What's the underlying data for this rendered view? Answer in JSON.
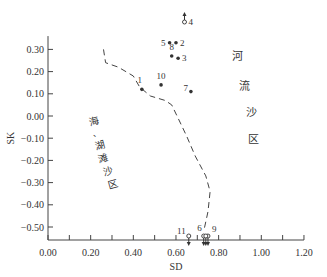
{
  "chart_data": {
    "type": "scatter",
    "title": "",
    "xlabel": "SD",
    "ylabel": "SK",
    "xlim": [
      0.0,
      1.2
    ],
    "ylim": [
      -0.55,
      0.33
    ],
    "x_ticks": [
      "0.00",
      "0.20",
      "0.40",
      "0.60",
      "0.80",
      "1.00",
      "1.20"
    ],
    "y_ticks": [
      "0.30",
      "0.20",
      "0.10",
      "0.00",
      "-0.10",
      "-0.20",
      "-0.30",
      "-0.40",
      "-0.50"
    ],
    "grid": false,
    "points": [
      {
        "label": "1",
        "sd": 0.44,
        "sk": 0.12,
        "marker": "filled"
      },
      {
        "label": "2",
        "sd": 0.6,
        "sk": 0.33,
        "marker": "filled"
      },
      {
        "label": "3",
        "sd": 0.61,
        "sk": 0.26,
        "marker": "filled"
      },
      {
        "label": "4",
        "sd": 0.64,
        "sk": 0.41,
        "marker": "open",
        "off_scale": "up"
      },
      {
        "label": "5",
        "sd": 0.57,
        "sk": 0.33,
        "marker": "filled"
      },
      {
        "label": "6",
        "sd": 0.73,
        "sk": -0.55,
        "marker": "open",
        "off_scale": "down"
      },
      {
        "label": "7",
        "sd": 0.67,
        "sk": 0.11,
        "marker": "filled"
      },
      {
        "label": "8",
        "sd": 0.58,
        "sk": 0.27,
        "marker": "filled"
      },
      {
        "label": "9",
        "sd": 0.75,
        "sk": -0.55,
        "marker": "open",
        "off_scale": "down"
      },
      {
        "label": "10",
        "sd": 0.53,
        "sk": 0.14,
        "marker": "filled"
      },
      {
        "label": "11",
        "sd": 0.66,
        "sk": -0.55,
        "marker": "open",
        "off_scale": "down"
      },
      {
        "label": "",
        "sd": 0.74,
        "sk": -0.55,
        "marker": "open",
        "off_scale": "down"
      }
    ],
    "boundary_line": {
      "style": "dashed",
      "points": [
        [
          0.26,
          0.3
        ],
        [
          0.27,
          0.24
        ],
        [
          0.33,
          0.22
        ],
        [
          0.4,
          0.18
        ],
        [
          0.43,
          0.13
        ],
        [
          0.48,
          0.09
        ],
        [
          0.55,
          0.07
        ],
        [
          0.58,
          0.05
        ],
        [
          0.61,
          -0.01
        ],
        [
          0.65,
          -0.09
        ],
        [
          0.69,
          -0.18
        ],
        [
          0.74,
          -0.27
        ],
        [
          0.76,
          -0.34
        ],
        [
          0.75,
          -0.43
        ],
        [
          0.73,
          -0.52
        ]
      ]
    },
    "annotations": [
      {
        "text": "河流沙区",
        "region": "right"
      },
      {
        "text": "海、湖滩沙区",
        "region": "left"
      }
    ]
  },
  "labels": {
    "river": [
      "河",
      "流",
      "沙",
      "区"
    ],
    "beach": [
      "海",
      "、",
      "湖",
      "滩",
      "沙",
      "区"
    ]
  }
}
